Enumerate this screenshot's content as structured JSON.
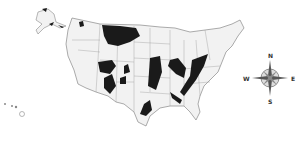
{
  "map": {
    "subject": "United States with shaded regions",
    "colors": {
      "land": "#f2f2f2",
      "border": "#888888",
      "shaded": "#1a1a1a",
      "background": "#ffffff"
    },
    "insets": [
      "Alaska",
      "Hawaii"
    ]
  },
  "compass": {
    "north": "N",
    "south": "S",
    "east": "E",
    "west": "W"
  }
}
